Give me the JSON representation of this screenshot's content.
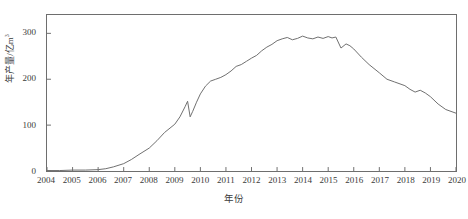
{
  "chart_data": {
    "type": "line",
    "title": "",
    "xlabel": "年份",
    "ylabel": "年产量/亿m³",
    "ylabel_base": "年产量/亿m",
    "ylabel_exp": "3",
    "xlim": [
      2004,
      2020
    ],
    "ylim": [
      0,
      340
    ],
    "grid": false,
    "legend": null,
    "y_ticks": [
      0,
      100,
      200,
      300
    ],
    "x_ticks": [
      2004,
      2005,
      2006,
      2007,
      2008,
      2009,
      2010,
      2011,
      2012,
      2013,
      2014,
      2015,
      2016,
      2017,
      2018,
      2019,
      2020
    ],
    "series": [
      {
        "name": "年产量",
        "color": "#6e6e6e",
        "x": [
          2004.0,
          2004.5,
          2005.0,
          2005.5,
          2006.0,
          2006.3,
          2006.6,
          2007.0,
          2007.3,
          2007.6,
          2008.0,
          2008.3,
          2008.6,
          2009.0,
          2009.2,
          2009.4,
          2009.5,
          2009.6,
          2009.7,
          2009.85,
          2010.0,
          2010.2,
          2010.4,
          2010.6,
          2010.8,
          2011.0,
          2011.2,
          2011.4,
          2011.6,
          2011.8,
          2012.0,
          2012.2,
          2012.4,
          2012.6,
          2012.8,
          2013.0,
          2013.2,
          2013.4,
          2013.6,
          2013.8,
          2014.0,
          2014.2,
          2014.4,
          2014.6,
          2014.8,
          2015.0,
          2015.15,
          2015.3,
          2015.5,
          2015.7,
          2015.85,
          2016.0,
          2016.3,
          2016.6,
          2017.0,
          2017.3,
          2017.6,
          2018.0,
          2018.2,
          2018.4,
          2018.6,
          2018.8,
          2019.0,
          2019.3,
          2019.6,
          2020.0
        ],
        "y": [
          1,
          1,
          2,
          2,
          3,
          5,
          9,
          16,
          25,
          36,
          50,
          66,
          84,
          102,
          118,
          140,
          152,
          118,
          130,
          150,
          168,
          185,
          196,
          200,
          204,
          210,
          218,
          228,
          232,
          239,
          246,
          252,
          262,
          270,
          276,
          284,
          288,
          291,
          286,
          289,
          294,
          290,
          288,
          292,
          289,
          293,
          290,
          292,
          268,
          277,
          273,
          266,
          248,
          232,
          214,
          200,
          194,
          186,
          178,
          172,
          176,
          170,
          162,
          146,
          134,
          126
        ]
      }
    ]
  },
  "figure": {
    "x_axis_title": "年份",
    "caption": ""
  }
}
